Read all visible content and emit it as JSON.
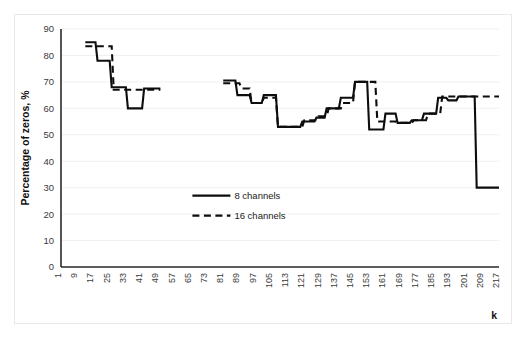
{
  "chart_data": {
    "type": "line",
    "title": "",
    "xlabel": "k",
    "ylabel": "Percentage of zeros, %",
    "ylim": [
      0,
      90
    ],
    "yticks": [
      0,
      10,
      20,
      30,
      40,
      50,
      60,
      70,
      80,
      90
    ],
    "xticks": [
      1,
      9,
      17,
      25,
      33,
      41,
      49,
      57,
      65,
      73,
      81,
      89,
      97,
      105,
      113,
      121,
      129,
      137,
      145,
      153,
      161,
      169,
      177,
      185,
      193,
      201,
      209,
      217
    ],
    "xlim": [
      1,
      217
    ],
    "grid": "horizontal",
    "legend_position": "center",
    "step_style": "post",
    "data_gap": {
      "from": 50,
      "to": 80,
      "note": "no data plotted between k=50 and k=80"
    },
    "series": [
      {
        "name": "8 channels",
        "style": "solid",
        "color": "#0d0d0d",
        "points": [
          {
            "x": 13,
            "y": 85
          },
          {
            "x": 18,
            "y": 85
          },
          {
            "x": 19,
            "y": 78
          },
          {
            "x": 25,
            "y": 78
          },
          {
            "x": 26,
            "y": 68
          },
          {
            "x": 33,
            "y": 68
          },
          {
            "x": 34,
            "y": 60
          },
          {
            "x": 41,
            "y": 60
          },
          {
            "x": 42,
            "y": 67.5
          },
          {
            "x": 50,
            "y": 67.5
          },
          {
            "x": 81,
            "y": 70.5
          },
          {
            "x": 87,
            "y": 70.5
          },
          {
            "x": 88,
            "y": 65
          },
          {
            "x": 94,
            "y": 65
          },
          {
            "x": 95,
            "y": 62
          },
          {
            "x": 100,
            "y": 62
          },
          {
            "x": 101,
            "y": 65
          },
          {
            "x": 107,
            "y": 65
          },
          {
            "x": 108,
            "y": 53
          },
          {
            "x": 119,
            "y": 53
          },
          {
            "x": 120,
            "y": 55
          },
          {
            "x": 126,
            "y": 55
          },
          {
            "x": 127,
            "y": 56.5
          },
          {
            "x": 131,
            "y": 56.5
          },
          {
            "x": 132,
            "y": 60
          },
          {
            "x": 138,
            "y": 60
          },
          {
            "x": 139,
            "y": 64
          },
          {
            "x": 145,
            "y": 64
          },
          {
            "x": 146,
            "y": 70
          },
          {
            "x": 152,
            "y": 70
          },
          {
            "x": 153,
            "y": 52
          },
          {
            "x": 160,
            "y": 52
          },
          {
            "x": 161,
            "y": 58
          },
          {
            "x": 166,
            "y": 58
          },
          {
            "x": 167,
            "y": 54.5
          },
          {
            "x": 173,
            "y": 54.5
          },
          {
            "x": 174,
            "y": 55.5
          },
          {
            "x": 179,
            "y": 55.5
          },
          {
            "x": 180,
            "y": 58
          },
          {
            "x": 186,
            "y": 58
          },
          {
            "x": 187,
            "y": 64
          },
          {
            "x": 191,
            "y": 64
          },
          {
            "x": 192,
            "y": 63
          },
          {
            "x": 196,
            "y": 63
          },
          {
            "x": 197,
            "y": 64.5
          },
          {
            "x": 205,
            "y": 64.5
          },
          {
            "x": 206,
            "y": 30
          },
          {
            "x": 217,
            "y": 30
          }
        ]
      },
      {
        "name": "16 channels",
        "style": "dashed",
        "color": "#0d0d0d",
        "points": [
          {
            "x": 13,
            "y": 83.5
          },
          {
            "x": 20,
            "y": 83.5
          },
          {
            "x": 21,
            "y": 83.5
          },
          {
            "x": 26,
            "y": 83.5
          },
          {
            "x": 27,
            "y": 67
          },
          {
            "x": 50,
            "y": 67
          },
          {
            "x": 81,
            "y": 69.5
          },
          {
            "x": 89,
            "y": 69.5
          },
          {
            "x": 90,
            "y": 67.5
          },
          {
            "x": 94,
            "y": 67.5
          },
          {
            "x": 95,
            "y": 62
          },
          {
            "x": 100,
            "y": 62
          },
          {
            "x": 101,
            "y": 64
          },
          {
            "x": 107,
            "y": 64
          },
          {
            "x": 108,
            "y": 53
          },
          {
            "x": 120,
            "y": 53
          },
          {
            "x": 121,
            "y": 55.5
          },
          {
            "x": 127,
            "y": 55.5
          },
          {
            "x": 128,
            "y": 57
          },
          {
            "x": 132,
            "y": 57
          },
          {
            "x": 133,
            "y": 60
          },
          {
            "x": 139,
            "y": 60
          },
          {
            "x": 140,
            "y": 62
          },
          {
            "x": 145,
            "y": 62
          },
          {
            "x": 146,
            "y": 70
          },
          {
            "x": 156,
            "y": 70
          },
          {
            "x": 157,
            "y": 55
          },
          {
            "x": 166,
            "y": 55
          },
          {
            "x": 167,
            "y": 54.5
          },
          {
            "x": 174,
            "y": 54.5
          },
          {
            "x": 175,
            "y": 55.5
          },
          {
            "x": 181,
            "y": 55.5
          },
          {
            "x": 182,
            "y": 58
          },
          {
            "x": 188,
            "y": 58
          },
          {
            "x": 189,
            "y": 64.5
          },
          {
            "x": 217,
            "y": 64.5
          }
        ]
      }
    ]
  },
  "legend": {
    "items": [
      {
        "label": "8 channels",
        "style": "solid"
      },
      {
        "label": "16 channels",
        "style": "dashed"
      }
    ]
  }
}
